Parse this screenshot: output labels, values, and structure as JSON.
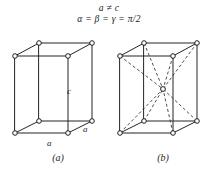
{
  "figure": {
    "conditions": {
      "line1": "a ≠ c",
      "line2": "α = β = γ = π/2"
    },
    "labels": {
      "c": "c",
      "a_front": "a",
      "a_side": "a"
    },
    "captions": {
      "left": "(a)",
      "right": "(b)"
    },
    "colors": {
      "edge": "#242424",
      "diagonal": "#3a3a3a",
      "node_fill": "#ffffff",
      "node_stroke": "#1f1f1f",
      "background": "#ffffff",
      "text": "#1f1f1f"
    },
    "cells": [
      {
        "name": "simple-tetragonal",
        "caption": "(a)",
        "has_body_center": false,
        "vertices": {
          "front_bottom_left": [
            15,
            133
          ],
          "front_bottom_right": [
            68,
            133
          ],
          "front_top_left": [
            15,
            56
          ],
          "front_top_right": [
            68,
            56
          ],
          "back_bottom_left": [
            39,
            121
          ],
          "back_bottom_right": [
            92,
            121
          ],
          "back_top_left": [
            39,
            43
          ],
          "back_top_right": [
            92,
            43
          ]
        }
      },
      {
        "name": "body-centered-tetragonal",
        "caption": "(b)",
        "has_body_center": true,
        "body_center": [
          163,
          89
        ],
        "vertices": {
          "front_bottom_left": [
            120,
            133
          ],
          "front_bottom_right": [
            173,
            133
          ],
          "front_top_left": [
            120,
            56
          ],
          "front_top_right": [
            173,
            56
          ],
          "back_bottom_left": [
            144,
            121
          ],
          "back_bottom_right": [
            197,
            121
          ],
          "back_top_left": [
            144,
            43
          ],
          "back_top_right": [
            197,
            43
          ]
        }
      }
    ]
  }
}
